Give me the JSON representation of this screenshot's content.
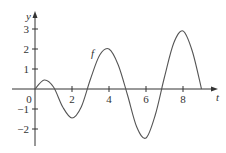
{
  "chart_data": {
    "type": "line",
    "title": "",
    "xlabel": "t",
    "ylabel": "y",
    "curve_label": "f",
    "xlim": [
      0,
      9.7
    ],
    "ylim": [
      -2.8,
      3.8
    ],
    "x_ticks": [
      0,
      2,
      4,
      6,
      8
    ],
    "y_ticks": [
      -2,
      -1,
      1,
      2,
      3
    ],
    "grid": false,
    "series": [
      {
        "name": "f",
        "x": [
          0,
          0.5,
          1,
          1.5,
          2,
          2.5,
          3,
          3.5,
          4,
          4.5,
          5,
          5.5,
          6,
          6.5,
          7,
          7.5,
          8,
          8.5,
          9
        ],
        "y": [
          0,
          0.45,
          0.1,
          -0.9,
          -1.45,
          -0.9,
          0.5,
          1.7,
          2.0,
          1.2,
          -0.3,
          -1.9,
          -2.45,
          -1.3,
          0.6,
          2.3,
          2.9,
          1.9,
          0
        ]
      }
    ]
  },
  "colors": {
    "axis": "#333333",
    "curve": "#555555"
  }
}
